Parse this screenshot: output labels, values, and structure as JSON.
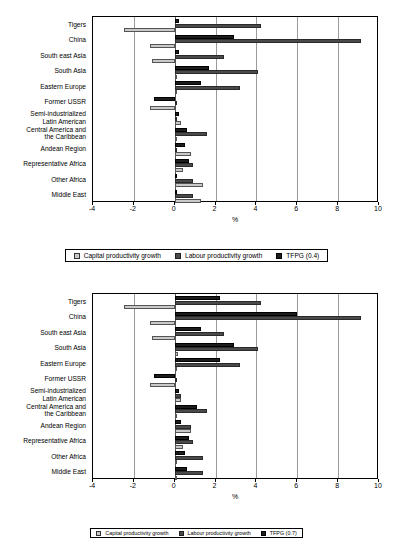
{
  "axis": {
    "xlabel": "%",
    "ticks": [
      "-4",
      "-2",
      "0",
      "2",
      "4",
      "6",
      "8",
      "10"
    ],
    "xmin": -4,
    "xmax": 10
  },
  "categories": [
    "Tigers",
    "China",
    "South east Asia",
    "South Asia",
    "Eastern Europe",
    "Former USSR",
    "Semi-industrialized\nLatin American",
    "Central America and\nthe Caribbean",
    "Andean Region",
    "Representative Africa",
    "Other Africa",
    "Middle East"
  ],
  "series_names": {
    "capital": "Capital productivity growth",
    "labour": "Labour productivity growth",
    "tfpg_top": "TFPG (0.4)",
    "tfpg_bottom": "TFPG (0.7)"
  },
  "colors": {
    "capital": "#c9c9c9",
    "labour": "#4a4a4a",
    "tfpg": "#1c1c1c",
    "grid": "#9a9a9a",
    "axis": "#000000"
  },
  "legend_top": [
    {
      "label": "Capital productivity growth",
      "key": "capital"
    },
    {
      "label": "Labour productivity growth",
      "key": "labour"
    },
    {
      "label": "TFPG (0.4)",
      "key": "tfpg"
    }
  ],
  "legend_bottom": [
    {
      "label": "Capital productivity growth",
      "key": "capital"
    },
    {
      "label": "Labour productivity growth",
      "key": "labour"
    },
    {
      "label": "TFPG (0.7)",
      "key": "tfpg"
    }
  ],
  "chart_data": [
    {
      "type": "bar",
      "orientation": "horizontal",
      "title": "",
      "xlabel": "%",
      "ylabel": "",
      "xlim": [
        -4,
        10
      ],
      "xticks": [
        -4,
        -2,
        0,
        2,
        4,
        6,
        8,
        10
      ],
      "grid": true,
      "legend_position": "bottom",
      "categories": [
        "Tigers",
        "China",
        "South east Asia",
        "South Asia",
        "Eastern Europe",
        "Former USSR",
        "Semi-industrialized Latin American",
        "Central America and the Caribbean",
        "Andean Region",
        "Representative Africa",
        "Other Africa",
        "Middle East"
      ],
      "series": [
        {
          "name": "TFPG (0.4)",
          "values": [
            0.2,
            2.9,
            0.2,
            1.7,
            1.3,
            -1.0,
            0.2,
            0.6,
            0.5,
            0.7,
            0.05,
            0.05
          ]
        },
        {
          "name": "Labour productivity growth",
          "values": [
            4.2,
            9.1,
            2.4,
            4.1,
            3.2,
            0.0,
            0.05,
            1.6,
            0.05,
            0.9,
            0.9,
            0.9
          ]
        },
        {
          "name": "Capital productivity growth",
          "values": [
            -2.5,
            -1.2,
            -1.1,
            0.1,
            0.0,
            -1.2,
            0.3,
            0.05,
            0.8,
            0.4,
            1.4,
            1.3
          ]
        }
      ]
    },
    {
      "type": "bar",
      "orientation": "horizontal",
      "title": "",
      "xlabel": "%",
      "ylabel": "",
      "xlim": [
        -4,
        10
      ],
      "xticks": [
        -4,
        -2,
        0,
        2,
        4,
        6,
        8,
        10
      ],
      "grid": true,
      "legend_position": "bottom",
      "categories": [
        "Tigers",
        "China",
        "South east Asia",
        "South Asia",
        "Eastern Europe",
        "Former USSR",
        "Semi-industrialized Latin American",
        "Central America and the Caribbean",
        "Andean Region",
        "Representative Africa",
        "Other Africa",
        "Middle East"
      ],
      "series": [
        {
          "name": "TFPG (0.7)",
          "values": [
            2.2,
            6.0,
            1.3,
            2.9,
            2.2,
            -1.0,
            0.2,
            1.1,
            0.3,
            0.7,
            0.5,
            0.6
          ]
        },
        {
          "name": "Labour productivity growth",
          "values": [
            4.2,
            9.1,
            2.4,
            4.1,
            3.2,
            0.0,
            0.3,
            1.6,
            0.8,
            0.9,
            1.4,
            1.4
          ]
        },
        {
          "name": "Capital productivity growth",
          "values": [
            -2.5,
            -1.2,
            -1.1,
            0.15,
            0.0,
            -1.2,
            0.3,
            0.05,
            0.8,
            0.4,
            0.05,
            0.05
          ]
        }
      ]
    }
  ]
}
